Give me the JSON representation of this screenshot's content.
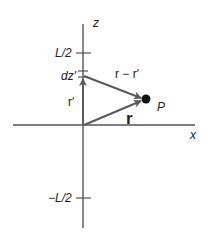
{
  "diagram": {
    "colors": {
      "axis": "#555555",
      "vector": "#5a5a5a",
      "point": "#111111",
      "text": "#222222"
    },
    "axes": {
      "z_label": "z",
      "x_label": "x"
    },
    "ticks": {
      "top_label": "L/2",
      "bottom_label": "−L/2"
    },
    "element": {
      "label": "dz′"
    },
    "vectors": {
      "r_prime_label": "r′",
      "r_minus_r_prime_label": "r − r′",
      "r_label": "r"
    },
    "point": {
      "label": "P"
    }
  }
}
